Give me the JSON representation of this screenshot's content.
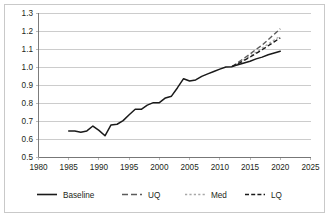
{
  "chart_data": {
    "type": "line",
    "title": "",
    "xlabel": "",
    "ylabel": "",
    "xlim": [
      1980,
      2025
    ],
    "ylim": [
      0.5,
      1.3
    ],
    "grid": true,
    "legend_position": "bottom",
    "xticks": [
      "1980",
      "1985",
      "1990",
      "1995",
      "2000",
      "2005",
      "2010",
      "2015",
      "2020",
      "2025"
    ],
    "yticks": [
      "1.3",
      "1.2",
      "1.1",
      "1.0",
      "0.9",
      "0.8",
      "0.7",
      "0.6",
      "0.5"
    ],
    "series": [
      {
        "name": "Baseline",
        "style": "solid",
        "color": "#1a1a1a",
        "x": [
          1985,
          1986,
          1987,
          1988,
          1989,
          1990,
          1991,
          1992,
          1993,
          1994,
          1995,
          1996,
          1997,
          1998,
          1999,
          2000,
          2001,
          2002,
          2003,
          2004,
          2005,
          2006,
          2007,
          2008,
          2009,
          2010,
          2011,
          2012,
          2013,
          2014,
          2015,
          2016,
          2017,
          2018,
          2019,
          2020
        ],
        "values": [
          0.645,
          0.645,
          0.638,
          0.645,
          0.672,
          0.648,
          0.618,
          0.678,
          0.682,
          0.702,
          0.735,
          0.765,
          0.765,
          0.788,
          0.802,
          0.802,
          0.828,
          0.838,
          0.885,
          0.935,
          0.922,
          0.928,
          0.948,
          0.962,
          0.975,
          0.988,
          1.0,
          1.002,
          1.012,
          1.022,
          1.032,
          1.045,
          1.055,
          1.068,
          1.078,
          1.088
        ]
      },
      {
        "name": "UQ",
        "style": "long-dash",
        "color": "#5c5c5c",
        "x": [
          2012,
          2013,
          2014,
          2015,
          2016,
          2017,
          2018,
          2019,
          2020
        ],
        "values": [
          1.002,
          1.025,
          1.048,
          1.072,
          1.098,
          1.122,
          1.152,
          1.182,
          1.212
        ]
      },
      {
        "name": "Med",
        "style": "dotted",
        "color": "#a8a8a8",
        "x": [
          2012,
          2013,
          2014,
          2015,
          2016,
          2017,
          2018,
          2019,
          2020
        ],
        "values": [
          1.002,
          1.02,
          1.04,
          1.06,
          1.082,
          1.105,
          1.128,
          1.15,
          1.172
        ]
      },
      {
        "name": "LQ",
        "style": "dash",
        "color": "#1a1a1a",
        "x": [
          2012,
          2013,
          2014,
          2015,
          2016,
          2017,
          2018,
          2019,
          2020
        ],
        "values": [
          1.002,
          1.018,
          1.036,
          1.055,
          1.075,
          1.096,
          1.118,
          1.14,
          1.162
        ]
      }
    ]
  },
  "legend": {
    "items": [
      {
        "label": "Baseline"
      },
      {
        "label": "UQ"
      },
      {
        "label": "Med"
      },
      {
        "label": "LQ"
      }
    ]
  }
}
